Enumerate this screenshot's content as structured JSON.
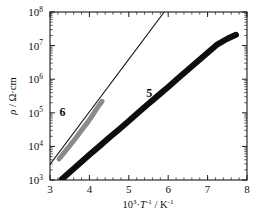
{
  "chart_data": {
    "type": "scatter",
    "title": "",
    "subtitle": "",
    "xlabel": "10³·T⁻¹ / K⁻¹",
    "xlabel_parts": {
      "base": "10",
      "base_exp": "3",
      "mid": "·",
      "variable": "T",
      "variable_exp": "-1",
      "separator": " / K",
      "unit_exp": "-1"
    },
    "ylabel": "ρ / Ω·cm",
    "ylabel_parts": {
      "symbol": "ρ",
      "separator": " / ",
      "unit": "Ω·cm"
    },
    "xscale": "linear",
    "yscale": "log",
    "xlim": [
      3,
      8
    ],
    "ylim": [
      1000,
      100000000
    ],
    "grid": false,
    "legend_position": "inline-annotations",
    "x_major_ticks": [
      3,
      4,
      5,
      6,
      7,
      8
    ],
    "x_major_tick_labels": [
      "3",
      "4",
      "5",
      "6",
      "7",
      "8"
    ],
    "x_minor_tick_step": 0.2,
    "y_major_ticks": [
      1000,
      10000,
      100000,
      1000000,
      10000000,
      100000000
    ],
    "y_major_tick_labels": [
      "10³",
      "10⁴",
      "10⁵",
      "10⁶",
      "10⁷",
      "10⁸"
    ],
    "y_major_tick_mantissa": "10",
    "y_major_tick_exponents": [
      "3",
      "4",
      "5",
      "6",
      "7",
      "8"
    ],
    "ticks_direction": "in",
    "frame": "all-four-sides",
    "series": [
      {
        "name": "5",
        "label": "5",
        "color": "#0d0d0d",
        "style": "dense-data-band",
        "band_thickness_px": 6,
        "annotation_position": {
          "x": 5.52,
          "y": 300000
        },
        "x_start": 3.3,
        "x_end": 7.72,
        "y_start": 1050,
        "y_end": 21000000,
        "points": [
          {
            "x": 3.3,
            "y": 1050
          },
          {
            "x": 3.5,
            "y": 1700
          },
          {
            "x": 3.75,
            "y": 3100
          },
          {
            "x": 4.0,
            "y": 5600
          },
          {
            "x": 4.25,
            "y": 10000
          },
          {
            "x": 4.5,
            "y": 18000
          },
          {
            "x": 4.75,
            "y": 32000
          },
          {
            "x": 5.0,
            "y": 57000
          },
          {
            "x": 5.25,
            "y": 103000
          },
          {
            "x": 5.5,
            "y": 185000
          },
          {
            "x": 5.75,
            "y": 330000
          },
          {
            "x": 6.0,
            "y": 590000
          },
          {
            "x": 6.25,
            "y": 1060000
          },
          {
            "x": 6.5,
            "y": 1900000
          },
          {
            "x": 6.75,
            "y": 3400000
          },
          {
            "x": 7.0,
            "y": 6100000
          },
          {
            "x": 7.25,
            "y": 10900000
          },
          {
            "x": 7.5,
            "y": 16000000
          },
          {
            "x": 7.72,
            "y": 21000000
          }
        ],
        "fit_slope_decades_per_unit": 0.955,
        "fit_intercept_log10_at_x0": 0.13
      },
      {
        "name": "6",
        "label": "6",
        "color": "#8a8a8a",
        "style": "dense-data-band-with-fit",
        "band_thickness_px": 5,
        "annotation_position": {
          "x": 3.32,
          "y": 82000
        },
        "x_start": 3.23,
        "x_end": 4.32,
        "y_start": 4200,
        "y_end": 220000,
        "points": [
          {
            "x": 3.23,
            "y": 4200
          },
          {
            "x": 3.35,
            "y": 6300
          },
          {
            "x": 3.5,
            "y": 10500
          },
          {
            "x": 3.65,
            "y": 17500
          },
          {
            "x": 3.8,
            "y": 30000
          },
          {
            "x": 3.95,
            "y": 51000
          },
          {
            "x": 4.1,
            "y": 92000
          },
          {
            "x": 4.2,
            "y": 140000
          },
          {
            "x": 4.32,
            "y": 220000
          }
        ],
        "fit_line": {
          "color": "#141414",
          "x_start": 3.0,
          "y_start": 2900,
          "x_end": 5.9,
          "y_end": 100000000,
          "slope_decades_per_unit": 1.68
        }
      }
    ]
  }
}
